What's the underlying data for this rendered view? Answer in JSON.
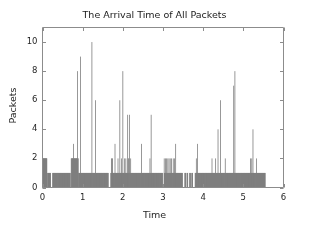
{
  "figure": {
    "width": 309,
    "height": 232,
    "background": "#ffffff"
  },
  "chart_data": {
    "type": "bar",
    "title": "The Arrival Time of All Packets",
    "xlabel": "Time",
    "ylabel": "Packets",
    "xlim": [
      0,
      6
    ],
    "ylim": [
      0,
      11
    ],
    "xticks": [
      0,
      1,
      2,
      3,
      4,
      5,
      6
    ],
    "xticklabels": [
      "0",
      "1",
      "2",
      "3",
      "4",
      "5",
      "6"
    ],
    "yticks": [
      0,
      2,
      4,
      6,
      8,
      10
    ],
    "yticklabels": [
      "0",
      "2",
      "4",
      "6",
      "8",
      "10"
    ],
    "grid": false,
    "legend": null,
    "bar_color": "#7f7f7f",
    "bar_edge_color": "#7f7f7f",
    "axes_color": "#8c8c8c",
    "bar_width": 0.012,
    "series": [
      {
        "name": "packets",
        "x": [
          0.005,
          0.018,
          0.03,
          0.042,
          0.055,
          0.068,
          0.08,
          0.092,
          0.105,
          0.13,
          0.145,
          0.158,
          0.17,
          0.185,
          0.2,
          0.255,
          0.268,
          0.28,
          0.295,
          0.31,
          0.325,
          0.34,
          0.355,
          0.37,
          0.385,
          0.4,
          0.415,
          0.43,
          0.445,
          0.46,
          0.475,
          0.49,
          0.505,
          0.52,
          0.535,
          0.55,
          0.565,
          0.58,
          0.595,
          0.61,
          0.625,
          0.64,
          0.655,
          0.67,
          0.685,
          0.715,
          0.73,
          0.745,
          0.758,
          0.772,
          0.785,
          0.8,
          0.815,
          0.83,
          0.845,
          0.858,
          0.872,
          0.885,
          0.9,
          0.915,
          0.93,
          0.945,
          0.96,
          0.975,
          0.99,
          1.005,
          1.02,
          1.035,
          1.05,
          1.065,
          1.08,
          1.095,
          1.11,
          1.125,
          1.14,
          1.155,
          1.17,
          1.185,
          1.2,
          1.215,
          1.23,
          1.245,
          1.26,
          1.275,
          1.29,
          1.305,
          1.32,
          1.335,
          1.35,
          1.365,
          1.38,
          1.395,
          1.41,
          1.425,
          1.44,
          1.455,
          1.47,
          1.485,
          1.5,
          1.515,
          1.53,
          1.545,
          1.56,
          1.575,
          1.59,
          1.605,
          1.62,
          1.635,
          1.7,
          1.715,
          1.73,
          1.745,
          1.76,
          1.775,
          1.79,
          1.805,
          1.82,
          1.835,
          1.85,
          1.865,
          1.88,
          1.895,
          1.91,
          1.925,
          1.94,
          1.955,
          1.97,
          1.985,
          2.0,
          2.015,
          2.03,
          2.045,
          2.06,
          2.075,
          2.09,
          2.105,
          2.12,
          2.135,
          2.15,
          2.165,
          2.18,
          2.195,
          2.21,
          2.225,
          2.24,
          2.255,
          2.27,
          2.285,
          2.3,
          2.315,
          2.33,
          2.345,
          2.36,
          2.375,
          2.39,
          2.405,
          2.42,
          2.435,
          2.45,
          2.465,
          2.48,
          2.495,
          2.51,
          2.525,
          2.54,
          2.555,
          2.57,
          2.585,
          2.6,
          2.615,
          2.63,
          2.645,
          2.66,
          2.675,
          2.69,
          2.705,
          2.72,
          2.735,
          2.75,
          2.765,
          2.78,
          2.795,
          2.81,
          2.825,
          2.84,
          2.855,
          2.87,
          2.885,
          2.9,
          2.915,
          2.93,
          2.945,
          2.96,
          2.975,
          2.99,
          3.03,
          3.045,
          3.06,
          3.075,
          3.09,
          3.105,
          3.12,
          3.135,
          3.15,
          3.165,
          3.18,
          3.195,
          3.21,
          3.225,
          3.24,
          3.255,
          3.27,
          3.285,
          3.3,
          3.315,
          3.33,
          3.345,
          3.36,
          3.375,
          3.39,
          3.405,
          3.42,
          3.435,
          3.45,
          3.465,
          3.48,
          3.545,
          3.56,
          3.6,
          3.615,
          3.665,
          3.68,
          3.72,
          3.735,
          3.8,
          3.815,
          3.83,
          3.845,
          3.86,
          3.875,
          3.89,
          3.905,
          3.92,
          3.935,
          3.95,
          3.965,
          3.98,
          3.995,
          4.01,
          4.025,
          4.04,
          4.055,
          4.07,
          4.085,
          4.1,
          4.115,
          4.13,
          4.145,
          4.16,
          4.175,
          4.19,
          4.205,
          4.22,
          4.235,
          4.25,
          4.265,
          4.28,
          4.295,
          4.31,
          4.325,
          4.34,
          4.355,
          4.37,
          4.385,
          4.4,
          4.415,
          4.43,
          4.445,
          4.46,
          4.475,
          4.49,
          4.505,
          4.52,
          4.535,
          4.55,
          4.565,
          4.58,
          4.595,
          4.61,
          4.625,
          4.64,
          4.655,
          4.67,
          4.685,
          4.7,
          4.715,
          4.73,
          4.745,
          4.76,
          4.775,
          4.79,
          4.805,
          4.82,
          4.835,
          4.85,
          4.865,
          4.88,
          4.895,
          4.91,
          4.925,
          4.94,
          4.955,
          4.97,
          4.985,
          5.0,
          5.015,
          5.03,
          5.045,
          5.06,
          5.075,
          5.09,
          5.105,
          5.12,
          5.135,
          5.15,
          5.165,
          5.18,
          5.195,
          5.21,
          5.225,
          5.24,
          5.255,
          5.27,
          5.285,
          5.3,
          5.315,
          5.33,
          5.345,
          5.36,
          5.375,
          5.39,
          5.405,
          5.42,
          5.435,
          5.45,
          5.465,
          5.48,
          5.495,
          5.51,
          5.525,
          5.54
        ],
        "values": [
          2,
          2,
          2,
          2,
          2,
          2,
          2,
          2,
          2,
          1,
          1,
          1,
          1,
          1,
          1,
          1,
          1,
          1,
          1,
          1,
          1,
          1,
          1,
          1,
          1,
          1,
          1,
          1,
          1,
          1,
          1,
          1,
          1,
          1,
          1,
          1,
          1,
          1,
          1,
          1,
          1,
          1,
          1,
          1,
          1,
          2,
          2,
          2,
          2,
          3,
          2,
          2,
          2,
          2,
          2,
          2,
          8,
          2,
          1,
          1,
          1,
          9,
          1,
          1,
          1,
          1,
          1,
          1,
          1,
          1,
          1,
          1,
          1,
          1,
          1,
          1,
          1,
          1,
          1,
          1,
          10,
          1,
          1,
          1,
          1,
          1,
          6,
          1,
          1,
          1,
          1,
          1,
          1,
          1,
          1,
          1,
          1,
          1,
          1,
          1,
          1,
          1,
          1,
          1,
          1,
          1,
          1,
          1,
          1,
          2,
          2,
          2,
          1,
          1,
          1,
          3,
          1,
          1,
          1,
          1,
          2,
          1,
          1,
          6,
          1,
          1,
          2,
          1,
          8,
          1,
          1,
          2,
          1,
          2,
          1,
          1,
          5,
          2,
          2,
          5,
          1,
          2,
          1,
          1,
          1,
          1,
          1,
          1,
          1,
          1,
          1,
          1,
          1,
          1,
          1,
          1,
          1,
          1,
          1,
          3,
          1,
          1,
          1,
          1,
          1,
          1,
          1,
          1,
          1,
          1,
          1,
          1,
          1,
          2,
          1,
          5,
          1,
          1,
          1,
          1,
          1,
          1,
          1,
          1,
          1,
          1,
          1,
          1,
          1,
          1,
          1,
          1,
          1,
          1,
          1,
          2,
          1,
          2,
          1,
          2,
          1,
          2,
          1,
          2,
          1,
          2,
          1,
          2,
          1,
          1,
          2,
          1,
          2,
          1,
          3,
          1,
          1,
          1,
          1,
          1,
          1,
          1,
          1,
          1,
          1,
          1,
          1,
          1,
          1,
          1,
          1,
          1,
          1,
          1,
          1,
          1,
          2,
          1,
          3,
          1,
          1,
          1,
          1,
          1,
          1,
          1,
          1,
          1,
          1,
          1,
          1,
          1,
          1,
          1,
          1,
          1,
          1,
          1,
          1,
          1,
          1,
          1,
          2,
          1,
          1,
          1,
          1,
          1,
          2,
          1,
          1,
          1,
          4,
          1,
          1,
          1,
          6,
          1,
          1,
          1,
          1,
          1,
          1,
          1,
          2,
          1,
          1,
          1,
          1,
          1,
          1,
          1,
          1,
          1,
          1,
          1,
          1,
          1,
          7,
          1,
          8,
          1,
          1,
          1,
          1,
          1,
          1,
          1,
          1,
          1,
          1,
          1,
          1,
          1,
          1,
          1,
          1,
          1,
          1,
          1,
          1,
          1,
          1,
          1,
          1,
          1,
          2,
          1,
          2,
          1,
          4,
          1,
          1,
          1,
          1,
          1,
          2,
          1,
          1,
          1,
          1,
          1,
          1,
          1,
          1,
          1,
          1,
          1,
          1,
          1,
          1
        ]
      }
    ],
    "baseline_segments": [
      {
        "start": 0.0,
        "end": 0.115,
        "level": 2
      },
      {
        "start": 0.0,
        "end": 0.115,
        "level": 1
      },
      {
        "start": 0.125,
        "end": 0.205,
        "level": 1
      },
      {
        "start": 0.25,
        "end": 0.7,
        "level": 1
      },
      {
        "start": 0.715,
        "end": 0.895,
        "level": 2
      },
      {
        "start": 0.9,
        "end": 1.64,
        "level": 1
      },
      {
        "start": 1.7,
        "end": 2.99,
        "level": 1
      },
      {
        "start": 3.02,
        "end": 3.49,
        "level": 1
      },
      {
        "start": 3.54,
        "end": 3.57,
        "level": 1
      },
      {
        "start": 3.59,
        "end": 3.62,
        "level": 1
      },
      {
        "start": 3.66,
        "end": 3.69,
        "level": 1
      },
      {
        "start": 3.71,
        "end": 3.745,
        "level": 1
      },
      {
        "start": 3.8,
        "end": 5.55,
        "level": 1
      }
    ]
  }
}
